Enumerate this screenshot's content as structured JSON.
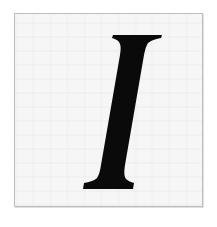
{
  "image": {
    "letter": "I",
    "style": "italic serif",
    "colors": {
      "glyph": "#0a0a0a",
      "background": "#f6f6f6",
      "border": "#bdbdbd"
    }
  }
}
